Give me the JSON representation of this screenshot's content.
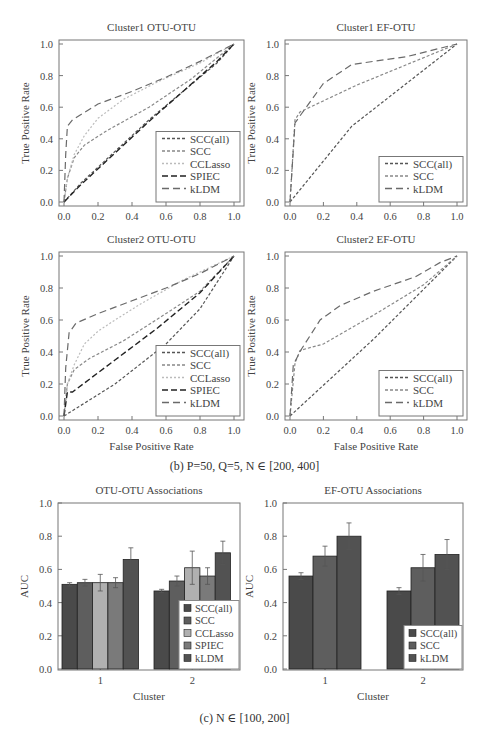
{
  "captions": {
    "b": "(b)  P=50, Q=5, N ∈ [200, 400]",
    "c": "(c)  N ∈ [100, 200]"
  },
  "colors": {
    "SCC(all)": "#555555",
    "SCC": "#888888",
    "CCLasso": "#bbbbbb",
    "SPIEC": "#222222",
    "kLDM": "#6a6a6a",
    "bar_SCC(all)": "#4a4a4a",
    "bar_SCC": "#5e5e5e",
    "bar_CCLasso": "#b0b0b0",
    "bar_SPIEC": "#7a7a7a",
    "bar_kLDM": "#525252"
  },
  "chart_data": [
    {
      "id": "roc1",
      "type": "line",
      "title": "Cluster1 OTU-OTU",
      "xlabel": "False Positive Rate",
      "ylabel": "True Positive Rate",
      "xlim": [
        0,
        1
      ],
      "ylim": [
        0,
        1
      ],
      "xticks": [
        "0.0",
        "0.2",
        "0.4",
        "0.6",
        "0.8",
        "1.0"
      ],
      "yticks": [
        "0.0",
        "0.2",
        "0.4",
        "0.6",
        "0.8",
        "1.0"
      ],
      "legend_position": "lower right",
      "series": [
        {
          "name": "SCC(all)",
          "dash": "3,2",
          "points": [
            [
              0,
              0
            ],
            [
              0.1,
              0.12
            ],
            [
              0.3,
              0.32
            ],
            [
              0.5,
              0.52
            ],
            [
              0.7,
              0.7
            ],
            [
              0.9,
              0.88
            ],
            [
              1,
              1
            ]
          ]
        },
        {
          "name": "SCC",
          "dash": "3,2",
          "points": [
            [
              0,
              0
            ],
            [
              0.02,
              0.15
            ],
            [
              0.06,
              0.28
            ],
            [
              0.12,
              0.36
            ],
            [
              0.25,
              0.45
            ],
            [
              0.5,
              0.6
            ],
            [
              0.75,
              0.78
            ],
            [
              1,
              1
            ]
          ]
        },
        {
          "name": "CCLasso",
          "dash": "2,2",
          "points": [
            [
              0,
              0
            ],
            [
              0.02,
              0.15
            ],
            [
              0.06,
              0.3
            ],
            [
              0.12,
              0.42
            ],
            [
              0.2,
              0.53
            ],
            [
              0.35,
              0.65
            ],
            [
              0.55,
              0.76
            ],
            [
              0.8,
              0.88
            ],
            [
              1,
              1
            ]
          ]
        },
        {
          "name": "SPIEC",
          "dash": "6,3",
          "points": [
            [
              0,
              0
            ],
            [
              0.1,
              0.11
            ],
            [
              0.3,
              0.31
            ],
            [
              0.5,
              0.51
            ],
            [
              0.7,
              0.7
            ],
            [
              0.9,
              0.89
            ],
            [
              1,
              1
            ]
          ]
        },
        {
          "name": "kLDM",
          "dash": "7,4",
          "points": [
            [
              0,
              0
            ],
            [
              0.01,
              0.3
            ],
            [
              0.02,
              0.48
            ],
            [
              0.05,
              0.52
            ],
            [
              0.2,
              0.62
            ],
            [
              0.4,
              0.7
            ],
            [
              0.6,
              0.79
            ],
            [
              0.8,
              0.89
            ],
            [
              1,
              1
            ]
          ]
        }
      ]
    },
    {
      "id": "roc2",
      "type": "line",
      "title": "Cluster1 EF-OTU",
      "xlabel": "False Positive Rate",
      "ylabel": "True Positive Rate",
      "xlim": [
        0,
        1
      ],
      "ylim": [
        0,
        1
      ],
      "xticks": [
        "0.0",
        "0.2",
        "0.4",
        "0.6",
        "0.8",
        "1.0"
      ],
      "yticks": [
        "0.0",
        "0.2",
        "0.4",
        "0.6",
        "0.8",
        "1.0"
      ],
      "legend_position": "lower right",
      "series": [
        {
          "name": "SCC(all)",
          "dash": "3,2",
          "points": [
            [
              0,
              0
            ],
            [
              0.37,
              0.48
            ],
            [
              1,
              1
            ]
          ]
        },
        {
          "name": "SCC",
          "dash": "3,2",
          "points": [
            [
              0,
              0
            ],
            [
              0.03,
              0.52
            ],
            [
              0.06,
              0.57
            ],
            [
              0.4,
              0.74
            ],
            [
              1,
              1
            ]
          ]
        },
        {
          "name": "kLDM",
          "dash": "7,4",
          "points": [
            [
              0,
              0
            ],
            [
              0.03,
              0.5
            ],
            [
              0.07,
              0.56
            ],
            [
              0.2,
              0.75
            ],
            [
              0.37,
              0.87
            ],
            [
              0.7,
              0.92
            ],
            [
              1,
              1
            ]
          ]
        }
      ]
    },
    {
      "id": "roc3",
      "type": "line",
      "title": "Cluster2 OTU-OTU",
      "xlabel": "False Positive Rate",
      "ylabel": "True Positive Rate",
      "xlim": [
        0,
        1
      ],
      "ylim": [
        0,
        1
      ],
      "xticks": [
        "0.0",
        "0.2",
        "0.4",
        "0.6",
        "0.8",
        "1.0"
      ],
      "yticks": [
        "0.0",
        "0.2",
        "0.4",
        "0.6",
        "0.8",
        "1.0"
      ],
      "legend_position": "lower right",
      "series": [
        {
          "name": "SCC(all)",
          "dash": "3,2",
          "points": [
            [
              0,
              0
            ],
            [
              0.3,
              0.2
            ],
            [
              0.6,
              0.45
            ],
            [
              0.8,
              0.67
            ],
            [
              1,
              1
            ]
          ]
        },
        {
          "name": "SCC",
          "dash": "3,2",
          "points": [
            [
              0,
              0
            ],
            [
              0.02,
              0.2
            ],
            [
              0.06,
              0.29
            ],
            [
              0.15,
              0.36
            ],
            [
              0.35,
              0.47
            ],
            [
              0.6,
              0.64
            ],
            [
              0.8,
              0.78
            ],
            [
              1,
              1
            ]
          ]
        },
        {
          "name": "CCLasso",
          "dash": "2,2",
          "points": [
            [
              0,
              0
            ],
            [
              0.02,
              0.2
            ],
            [
              0.06,
              0.32
            ],
            [
              0.12,
              0.45
            ],
            [
              0.2,
              0.53
            ],
            [
              0.3,
              0.6
            ],
            [
              0.45,
              0.7
            ],
            [
              0.7,
              0.85
            ],
            [
              1,
              1
            ]
          ]
        },
        {
          "name": "SPIEC",
          "dash": "6,3",
          "points": [
            [
              0,
              0
            ],
            [
              0.02,
              0.15
            ],
            [
              0.05,
              0.15
            ],
            [
              0.3,
              0.35
            ],
            [
              0.55,
              0.55
            ],
            [
              0.8,
              0.77
            ],
            [
              1,
              1
            ]
          ]
        },
        {
          "name": "kLDM",
          "dash": "7,4",
          "points": [
            [
              0,
              0
            ],
            [
              0.01,
              0.3
            ],
            [
              0.03,
              0.52
            ],
            [
              0.07,
              0.58
            ],
            [
              0.2,
              0.64
            ],
            [
              0.4,
              0.72
            ],
            [
              0.6,
              0.8
            ],
            [
              0.8,
              0.89
            ],
            [
              1,
              1
            ]
          ]
        }
      ]
    },
    {
      "id": "roc4",
      "type": "line",
      "title": "Cluster2 EF-OTU",
      "xlabel": "False Positive Rate",
      "ylabel": "True Positive Rate",
      "xlim": [
        0,
        1
      ],
      "ylim": [
        0,
        1
      ],
      "xticks": [
        "0.0",
        "0.2",
        "0.4",
        "0.6",
        "0.8",
        "1.0"
      ],
      "yticks": [
        "0.0",
        "0.2",
        "0.4",
        "0.6",
        "0.8",
        "1.0"
      ],
      "legend_position": "lower right",
      "series": [
        {
          "name": "SCC(all)",
          "dash": "3,2",
          "points": [
            [
              0,
              0
            ],
            [
              0.5,
              0.48
            ],
            [
              1,
              1
            ]
          ]
        },
        {
          "name": "SCC",
          "dash": "3,2",
          "points": [
            [
              0,
              0
            ],
            [
              0.03,
              0.33
            ],
            [
              0.06,
              0.41
            ],
            [
              0.2,
              0.45
            ],
            [
              0.5,
              0.63
            ],
            [
              0.8,
              0.82
            ],
            [
              1,
              1
            ]
          ]
        },
        {
          "name": "kLDM",
          "dash": "7,4",
          "points": [
            [
              0,
              0
            ],
            [
              0.02,
              0.32
            ],
            [
              0.07,
              0.42
            ],
            [
              0.18,
              0.6
            ],
            [
              0.3,
              0.69
            ],
            [
              0.5,
              0.78
            ],
            [
              0.75,
              0.87
            ],
            [
              0.9,
              0.96
            ],
            [
              1,
              1
            ]
          ]
        }
      ]
    },
    {
      "id": "bar1",
      "type": "bar",
      "title": "OTU-OTU Associations",
      "xlabel": "Cluster",
      "ylabel": "AUC",
      "ylim": [
        0,
        1
      ],
      "yticks": [
        "0.0",
        "0.2",
        "0.4",
        "0.6",
        "0.8",
        "1.0"
      ],
      "categories": [
        "1",
        "2"
      ],
      "legend_position": "lower right",
      "series": [
        {
          "name": "SCC(all)",
          "values": [
            0.51,
            0.47
          ],
          "errors": [
            0.01,
            0.01
          ]
        },
        {
          "name": "SCC",
          "values": [
            0.52,
            0.53
          ],
          "errors": [
            0.02,
            0.03
          ]
        },
        {
          "name": "CCLasso",
          "values": [
            0.52,
            0.61
          ],
          "errors": [
            0.05,
            0.1
          ]
        },
        {
          "name": "SPIEC",
          "values": [
            0.52,
            0.56
          ],
          "errors": [
            0.03,
            0.05
          ]
        },
        {
          "name": "kLDM",
          "values": [
            0.66,
            0.7
          ],
          "errors": [
            0.07,
            0.07
          ]
        }
      ]
    },
    {
      "id": "bar2",
      "type": "bar",
      "title": "EF-OTU Associations",
      "xlabel": "Cluster",
      "ylabel": "AUC",
      "ylim": [
        0,
        1
      ],
      "yticks": [
        "0.0",
        "0.2",
        "0.4",
        "0.6",
        "0.8",
        "1.0"
      ],
      "categories": [
        "1",
        "2"
      ],
      "legend_position": "lower right",
      "series": [
        {
          "name": "SCC(all)",
          "values": [
            0.56,
            0.47
          ],
          "errors": [
            0.02,
            0.02
          ]
        },
        {
          "name": "SCC",
          "values": [
            0.68,
            0.61
          ],
          "errors": [
            0.06,
            0.08
          ]
        },
        {
          "name": "kLDM",
          "values": [
            0.8,
            0.69
          ],
          "errors": [
            0.08,
            0.09
          ]
        }
      ]
    }
  ]
}
